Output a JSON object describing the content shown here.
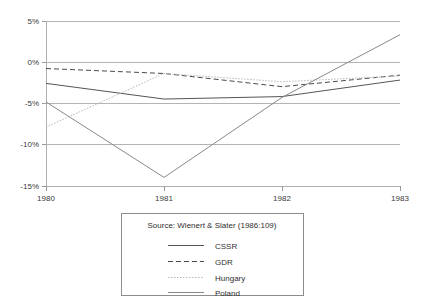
{
  "chart_data": {
    "type": "line",
    "title": "",
    "xlabel": "",
    "ylabel": "",
    "x": [
      1980,
      1981,
      1982,
      1983
    ],
    "categories": [
      "1980",
      "1981",
      "1982",
      "1983"
    ],
    "xtick_labels": [
      "1980",
      "1981",
      "1982",
      "1983"
    ],
    "ytick_labels": [
      "5%",
      "0%",
      "-5%",
      "-10%",
      "-15%"
    ],
    "ytick_values": [
      5,
      0,
      -5,
      -10,
      -15
    ],
    "ylim": [
      -15,
      5
    ],
    "xlim": [
      1980,
      1983
    ],
    "grid": true,
    "legend_position": "below-center",
    "source_note": "Source: Wienert & Slater (1986:109)",
    "series": [
      {
        "name": "CSSR",
        "style": "solid",
        "color": "#555555",
        "width": 1,
        "values": [
          -2.5,
          -4.4,
          -4.1,
          -2.1
        ]
      },
      {
        "name": "GDR",
        "style": "dashed",
        "color": "#4a4a4a",
        "width": 1,
        "values": [
          -0.7,
          -1.3,
          -2.9,
          -1.5
        ]
      },
      {
        "name": "Hungary",
        "style": "dotted",
        "color": "#b9b9b9",
        "width": 1,
        "values": [
          -7.8,
          -1.3,
          -2.3,
          -1.6
        ]
      },
      {
        "name": "Poland",
        "style": "solid",
        "color": "#888888",
        "width": 1,
        "values": [
          -4.75,
          -13.9,
          -4.2,
          3.4
        ]
      }
    ]
  },
  "legend": {
    "source_label": "Source: Wienert & Slater (1986:109)",
    "entries": [
      {
        "label": "CSSR"
      },
      {
        "label": "GDR"
      },
      {
        "label": "Hungary"
      },
      {
        "label": "Poland"
      }
    ]
  },
  "colors": {
    "grid": "#b4b4b4",
    "axis": "#b0b0b0",
    "text": "#3a3a3a",
    "background": "#ffffff"
  }
}
